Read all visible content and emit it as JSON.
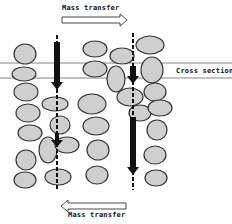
{
  "labels": {
    "top_arrow": "Mass transfer",
    "bottom_arrow": "Mass transfer",
    "cross_section": "Cross section"
  },
  "colors": {
    "particle_fill": "#cfcfcf",
    "particle_stroke": "#333333",
    "arrow": "#111111",
    "line": "#555555"
  }
}
